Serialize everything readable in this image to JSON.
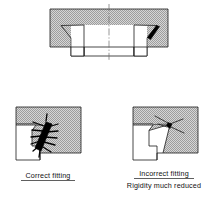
{
  "figure": {
    "background_color": "#ffffff",
    "line_color": "#1a1a1a",
    "hatch_color": "#9a9a9a",
    "hatch_background": "#d2d2d2",
    "weld_color": "#000000"
  },
  "views": {
    "top": {
      "name": "assembly-section-view",
      "description": "Sectional view of flanged hub assembly with weld at right side and vertical centreline"
    },
    "bottom_left": {
      "name": "correct-fitting-detail",
      "caption": "Correct fitting",
      "caption_underlined": true,
      "second_line": ""
    },
    "bottom_right": {
      "name": "incorrect-fitting-detail",
      "caption": "Incorrect fitting",
      "caption_underlined": true,
      "second_line": "Rigidity much reduced"
    }
  },
  "labels": {
    "correct_fitting": "Correct fitting",
    "incorrect_fitting": "Incorrect fitting",
    "rigidity_note": "Rigidity much reduced"
  }
}
